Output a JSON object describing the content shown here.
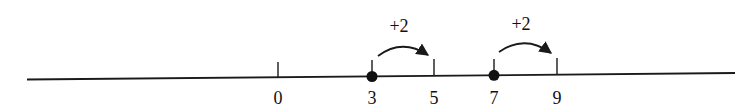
{
  "diagram": {
    "type": "number-line",
    "colors": {
      "line": "#1a1a1a",
      "text": "#111111",
      "background": "#ffffff"
    },
    "ticks": [
      {
        "value": "0",
        "x": 278,
        "y": 78,
        "dot": false
      },
      {
        "value": "3",
        "x": 372,
        "y": 76,
        "dot": true
      },
      {
        "value": "5",
        "x": 434,
        "y": 75,
        "dot": false
      },
      {
        "value": "7",
        "x": 494,
        "y": 75,
        "dot": true
      },
      {
        "value": "9",
        "x": 557,
        "y": 74,
        "dot": false
      }
    ],
    "jumps": [
      {
        "label": "+2",
        "from": "3",
        "to": "5"
      },
      {
        "label": "+2",
        "from": "7",
        "to": "9"
      }
    ]
  }
}
